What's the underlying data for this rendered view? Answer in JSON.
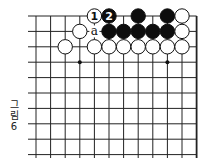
{
  "diagram": {
    "caption": [
      "그",
      "림",
      "6"
    ],
    "grid": {
      "x": [
        36,
        50.6,
        65.2,
        79.8,
        94.4,
        109,
        123.6,
        138.2,
        152.8,
        167.4,
        182,
        196.6
      ],
      "y": [
        16,
        31.4,
        46.8,
        62.2,
        77.6,
        93,
        108.4,
        123.8,
        139.2,
        154.6
      ],
      "left_extend": 28,
      "bottom_extend": 158,
      "right_edge_board": true,
      "line_color": "#222222"
    },
    "star_points": [
      {
        "col": 3,
        "row": 3
      },
      {
        "col": 9,
        "row": 3
      }
    ],
    "stones": [
      {
        "col": 4,
        "row": 0,
        "color": "white",
        "label": "1"
      },
      {
        "col": 5,
        "row": 0,
        "color": "black",
        "label": "2"
      },
      {
        "col": 7,
        "row": 0,
        "color": "black",
        "label": ""
      },
      {
        "col": 9,
        "row": 0,
        "color": "black",
        "label": ""
      },
      {
        "col": 10,
        "row": 0,
        "color": "white",
        "label": ""
      },
      {
        "col": 3,
        "row": 1,
        "color": "white",
        "label": ""
      },
      {
        "col": 5,
        "row": 1,
        "color": "black",
        "label": ""
      },
      {
        "col": 6,
        "row": 1,
        "color": "black",
        "label": ""
      },
      {
        "col": 7,
        "row": 1,
        "color": "black",
        "label": ""
      },
      {
        "col": 8,
        "row": 1,
        "color": "black",
        "label": ""
      },
      {
        "col": 9,
        "row": 1,
        "color": "black",
        "label": ""
      },
      {
        "col": 10,
        "row": 1,
        "color": "white",
        "label": ""
      },
      {
        "col": 2,
        "row": 2,
        "color": "white",
        "label": ""
      },
      {
        "col": 4,
        "row": 2,
        "color": "white",
        "label": ""
      },
      {
        "col": 5,
        "row": 2,
        "color": "white",
        "label": ""
      },
      {
        "col": 6,
        "row": 2,
        "color": "white",
        "label": ""
      },
      {
        "col": 7,
        "row": 2,
        "color": "white",
        "label": ""
      },
      {
        "col": 8,
        "row": 2,
        "color": "white",
        "label": ""
      },
      {
        "col": 9,
        "row": 2,
        "color": "white",
        "label": ""
      },
      {
        "col": 10,
        "row": 2,
        "color": "white",
        "label": ""
      }
    ],
    "labels": [
      {
        "col": 4,
        "row": 1,
        "text": "a"
      }
    ]
  }
}
